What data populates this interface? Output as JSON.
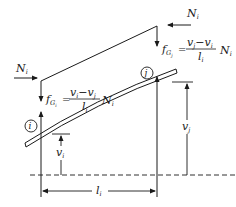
{
  "diagram": {
    "type": "structural-beam-element",
    "nodes": [
      {
        "id": "i",
        "label": "i"
      },
      {
        "id": "j",
        "label": "j"
      }
    ],
    "forces": {
      "left_axial": {
        "symbol": "N",
        "sub": "i"
      },
      "right_axial": {
        "symbol": "N",
        "sub": "i"
      }
    },
    "equations": {
      "left": {
        "lhs_symbol": "f",
        "lhs_sub": "G",
        "lhs_subsub": "i",
        "equals": "=",
        "numerator": "vᵢ − vⱼ",
        "num_a": "v",
        "num_a_sub": "i",
        "minus": "−",
        "num_b": "v",
        "num_b_sub": "j",
        "denominator": "l",
        "den_sub": "i",
        "factor": "N",
        "factor_sub": "i"
      },
      "right": {
        "lhs_symbol": "f",
        "lhs_sub": "G",
        "lhs_subsub": "j",
        "equals": "=",
        "num_a": "v",
        "num_a_sub": "j",
        "minus": "−",
        "num_b": "v",
        "num_b_sub": "i",
        "denominator": "l",
        "den_sub": "i",
        "factor": "N",
        "factor_sub": "i"
      }
    },
    "dimensions": {
      "v_i": {
        "symbol": "v",
        "sub": "i"
      },
      "v_j": {
        "symbol": "v",
        "sub": "j"
      },
      "l_i": {
        "symbol": "l",
        "sub": "i"
      }
    },
    "colors": {
      "ink": "#1a1a1a",
      "background": "#ffffff"
    }
  }
}
